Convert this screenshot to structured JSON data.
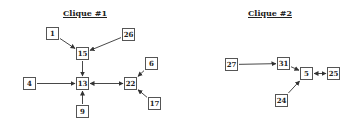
{
  "diagram": {
    "cliques": [
      {
        "title": "Clique #1",
        "title_pos": [
          85,
          13
        ],
        "nodes": [
          {
            "id": "1",
            "x": 46,
            "y": 27
          },
          {
            "id": "26",
            "x": 122,
            "y": 28
          },
          {
            "id": "15",
            "x": 76,
            "y": 47
          },
          {
            "id": "4",
            "x": 23,
            "y": 77
          },
          {
            "id": "13",
            "x": 76,
            "y": 77
          },
          {
            "id": "22",
            "x": 124,
            "y": 77
          },
          {
            "id": "6",
            "x": 145,
            "y": 57
          },
          {
            "id": "17",
            "x": 148,
            "y": 97
          },
          {
            "id": "9",
            "x": 76,
            "y": 105
          }
        ],
        "edges": [
          {
            "from": "1",
            "to": "15",
            "type": "directed"
          },
          {
            "from": "26",
            "to": "15",
            "type": "directed"
          },
          {
            "from": "15",
            "to": "13",
            "type": "directed"
          },
          {
            "from": "4",
            "to": "13",
            "type": "directed"
          },
          {
            "from": "9",
            "to": "13",
            "type": "directed"
          },
          {
            "from": "13",
            "to": "22",
            "type": "bidirectional"
          },
          {
            "from": "6",
            "to": "22",
            "type": "directed"
          },
          {
            "from": "17",
            "to": "22",
            "type": "directed"
          }
        ]
      },
      {
        "title": "Clique #2",
        "title_pos": [
          270,
          13
        ],
        "nodes": [
          {
            "id": "27",
            "x": 225,
            "y": 58
          },
          {
            "id": "31",
            "x": 277,
            "y": 57
          },
          {
            "id": "5",
            "x": 300,
            "y": 67
          },
          {
            "id": "25",
            "x": 327,
            "y": 67
          },
          {
            "id": "24",
            "x": 275,
            "y": 94
          }
        ],
        "edges": [
          {
            "from": "27",
            "to": "31",
            "type": "directed"
          },
          {
            "from": "31",
            "to": "5",
            "type": "directed"
          },
          {
            "from": "24",
            "to": "5",
            "type": "directed"
          },
          {
            "from": "5",
            "to": "25",
            "type": "bidirectional"
          }
        ]
      }
    ]
  },
  "colors": {
    "stroke": "#333333",
    "box_border": "#555555",
    "text": "#222222",
    "background": "#ffffff"
  }
}
